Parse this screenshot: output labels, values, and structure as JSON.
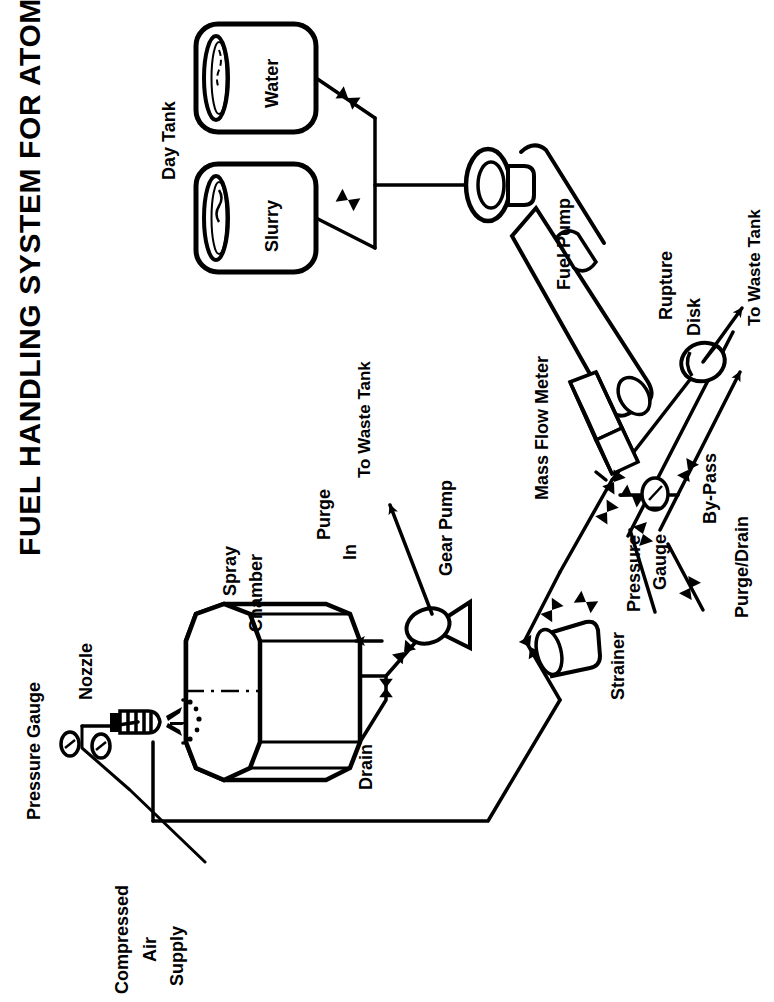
{
  "figure": {
    "title": "FUEL HANDLING SYSTEM FOR ATOMIZATION TESTS",
    "orientation": "rotated-90-ccw",
    "style": "black-and-white engineering line drawing",
    "background_color": "#ffffff",
    "line_color": "#000000"
  },
  "labels": {
    "pressure_gauge_air": "Pressure Gauge",
    "compressed_air_supply": "Compressed\nAir\nSupply",
    "compressed_air_line1": "Compressed",
    "compressed_air_line2": "Air",
    "compressed_air_line3": "Supply",
    "nozzle": "Nozzle",
    "spray_chamber_line1": "Spray",
    "spray_chamber_line2": "Chamber",
    "purge_in_line1": "Purge",
    "purge_in_line2": "In",
    "drain": "Drain",
    "to_waste_tank_upper": "To Waste Tank",
    "gear_pump": "Gear Pump",
    "day_tank": "Day Tank",
    "water_tank": "Water",
    "slurry_tank": "Slurry",
    "fuel_pump": "Fuel Pump",
    "mass_flow_meter": "Mass Flow Meter",
    "strainer": "Strainer",
    "pressure_gauge_line": "Pressure\nGauge",
    "pressure_gauge_l1": "Pressure",
    "pressure_gauge_l2": "Gauge",
    "rupture_disk_l1": "Rupture",
    "rupture_disk_l2": "Disk",
    "to_waste_tank_lower": "To Waste Tank",
    "by_pass": "By-Pass",
    "purge_drain": "Purge/Drain"
  },
  "components": [
    {
      "id": "spray-chamber",
      "name": "Spray Chamber",
      "shape": "octagonal-prism"
    },
    {
      "id": "nozzle",
      "name": "Nozzle",
      "shape": "ribbed-cylinder-with-spray"
    },
    {
      "id": "pressure-gauge-air",
      "name": "Pressure Gauge",
      "shape": "dial-circle"
    },
    {
      "id": "gear-pump",
      "name": "Gear Pump",
      "shape": "ellipse-with-triangle"
    },
    {
      "id": "day-tank-water",
      "name": "Water",
      "shape": "vertical-tank"
    },
    {
      "id": "day-tank-slurry",
      "name": "Slurry",
      "shape": "vertical-tank"
    },
    {
      "id": "fuel-pump",
      "name": "Fuel Pump",
      "shape": "motor-with-cylinder"
    },
    {
      "id": "mass-flow-meter",
      "name": "Mass Flow Meter",
      "shape": "rectangular-box"
    },
    {
      "id": "strainer",
      "name": "Strainer",
      "shape": "inline-cylinder"
    },
    {
      "id": "pressure-gauge-line",
      "name": "Pressure Gauge",
      "shape": "dial-circle"
    },
    {
      "id": "rupture-disk",
      "name": "Rupture Disk",
      "shape": "inline-disk"
    }
  ],
  "flow_arrows": [
    {
      "label": "Purge In",
      "direction": "into-chamber"
    },
    {
      "label": "To Waste Tank",
      "direction": "out-from-gear-pump"
    },
    {
      "label": "To Waste Tank",
      "direction": "out-from-rupture-disk"
    },
    {
      "label": "By-Pass",
      "direction": "out-to-waste"
    },
    {
      "label": "Purge/Drain",
      "direction": "into-line"
    }
  ],
  "valves_count": 9
}
